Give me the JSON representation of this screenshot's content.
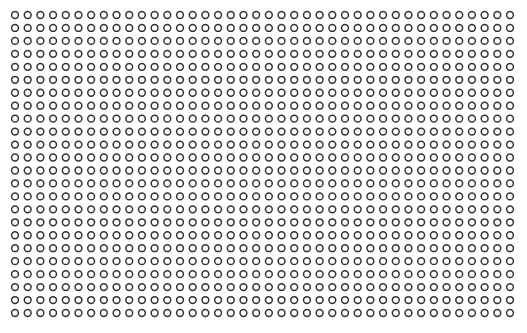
{
  "pattern": {
    "description": "Uniform grid of hollow circles",
    "rows": 24,
    "columns": 40,
    "shape": "hollow-circle",
    "stroke_color": "#333333",
    "fill_color": "none",
    "background_color": "#ffffff"
  }
}
